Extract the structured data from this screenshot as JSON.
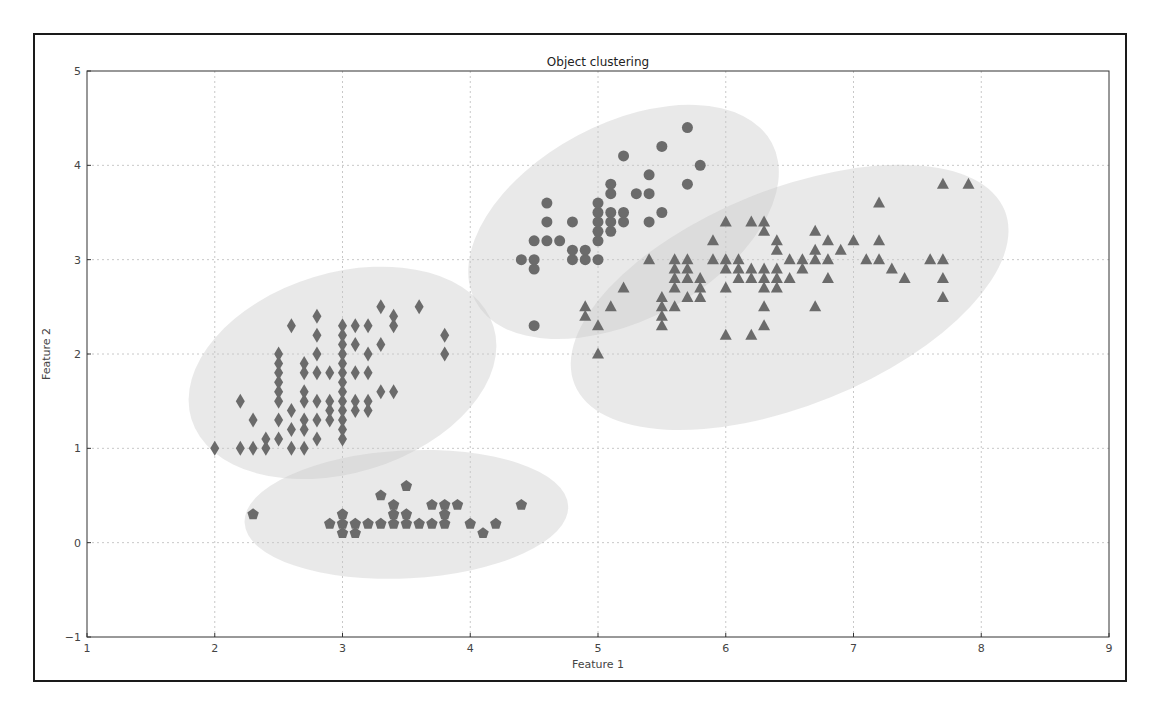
{
  "chart_data": {
    "type": "scatter",
    "title": "Object clustering",
    "xlabel": "Feature 1",
    "ylabel": "Feature 2",
    "xlim": [
      1,
      9
    ],
    "ylim": [
      -1,
      5
    ],
    "xticks": [
      1,
      2,
      3,
      4,
      5,
      6,
      7,
      8,
      9
    ],
    "yticks": [
      -1,
      0,
      1,
      2,
      3,
      4,
      5
    ],
    "grid": true,
    "legend": null,
    "marker_color": "#6b6b6b",
    "ellipse_color": "#c8c8c8",
    "series": [
      {
        "name": "cluster-diamond",
        "marker": "diamond",
        "points": [
          [
            2.0,
            1.0
          ],
          [
            2.2,
            1.0
          ],
          [
            2.3,
            1.0
          ],
          [
            2.4,
            1.0
          ],
          [
            2.4,
            1.1
          ],
          [
            2.5,
            1.1
          ],
          [
            2.6,
            1.0
          ],
          [
            2.7,
            1.0
          ],
          [
            2.2,
            1.5
          ],
          [
            2.3,
            1.3
          ],
          [
            2.5,
            1.3
          ],
          [
            2.5,
            1.5
          ],
          [
            2.5,
            1.6
          ],
          [
            2.5,
            1.7
          ],
          [
            2.5,
            1.8
          ],
          [
            2.5,
            1.9
          ],
          [
            2.5,
            2.0
          ],
          [
            2.6,
            1.2
          ],
          [
            2.6,
            1.4
          ],
          [
            2.6,
            2.3
          ],
          [
            2.7,
            1.2
          ],
          [
            2.7,
            1.3
          ],
          [
            2.7,
            1.5
          ],
          [
            2.7,
            1.6
          ],
          [
            2.7,
            1.8
          ],
          [
            2.7,
            1.9
          ],
          [
            2.8,
            1.1
          ],
          [
            2.8,
            1.3
          ],
          [
            2.8,
            1.5
          ],
          [
            2.8,
            1.8
          ],
          [
            2.8,
            2.0
          ],
          [
            2.8,
            2.2
          ],
          [
            2.8,
            2.4
          ],
          [
            2.9,
            1.3
          ],
          [
            2.9,
            1.4
          ],
          [
            2.9,
            1.5
          ],
          [
            2.9,
            1.8
          ],
          [
            3.0,
            1.1
          ],
          [
            3.0,
            1.2
          ],
          [
            3.0,
            1.3
          ],
          [
            3.0,
            1.4
          ],
          [
            3.0,
            1.5
          ],
          [
            3.0,
            1.6
          ],
          [
            3.0,
            1.7
          ],
          [
            3.0,
            1.8
          ],
          [
            3.0,
            1.9
          ],
          [
            3.0,
            2.0
          ],
          [
            3.0,
            2.1
          ],
          [
            3.0,
            2.2
          ],
          [
            3.0,
            2.3
          ],
          [
            3.1,
            1.4
          ],
          [
            3.1,
            1.5
          ],
          [
            3.1,
            1.8
          ],
          [
            3.1,
            2.1
          ],
          [
            3.1,
            2.3
          ],
          [
            3.2,
            1.4
          ],
          [
            3.2,
            1.5
          ],
          [
            3.2,
            1.8
          ],
          [
            3.2,
            2.0
          ],
          [
            3.2,
            2.3
          ],
          [
            3.3,
            1.6
          ],
          [
            3.3,
            2.1
          ],
          [
            3.3,
            2.5
          ],
          [
            3.4,
            1.6
          ],
          [
            3.4,
            2.3
          ],
          [
            3.4,
            2.4
          ],
          [
            3.6,
            2.5
          ],
          [
            3.8,
            2.0
          ],
          [
            3.8,
            2.2
          ]
        ]
      },
      {
        "name": "cluster-pentagon",
        "marker": "pentagon",
        "points": [
          [
            2.3,
            0.3
          ],
          [
            2.9,
            0.2
          ],
          [
            3.0,
            0.1
          ],
          [
            3.0,
            0.2
          ],
          [
            3.0,
            0.3
          ],
          [
            3.1,
            0.1
          ],
          [
            3.1,
            0.2
          ],
          [
            3.2,
            0.2
          ],
          [
            3.3,
            0.2
          ],
          [
            3.3,
            0.5
          ],
          [
            3.4,
            0.2
          ],
          [
            3.4,
            0.3
          ],
          [
            3.4,
            0.4
          ],
          [
            3.5,
            0.2
          ],
          [
            3.5,
            0.3
          ],
          [
            3.5,
            0.6
          ],
          [
            3.6,
            0.2
          ],
          [
            3.7,
            0.2
          ],
          [
            3.7,
            0.4
          ],
          [
            3.8,
            0.2
          ],
          [
            3.8,
            0.3
          ],
          [
            3.8,
            0.4
          ],
          [
            3.9,
            0.4
          ],
          [
            4.0,
            0.2
          ],
          [
            4.1,
            0.1
          ],
          [
            4.2,
            0.2
          ],
          [
            4.4,
            0.4
          ]
        ]
      },
      {
        "name": "cluster-circle",
        "marker": "circle",
        "points": [
          [
            4.5,
            2.3
          ],
          [
            4.4,
            3.0
          ],
          [
            4.5,
            2.9
          ],
          [
            4.5,
            3.0
          ],
          [
            4.5,
            3.2
          ],
          [
            4.6,
            3.2
          ],
          [
            4.6,
            3.4
          ],
          [
            4.6,
            3.6
          ],
          [
            4.7,
            3.2
          ],
          [
            4.8,
            3.0
          ],
          [
            4.8,
            3.1
          ],
          [
            4.8,
            3.4
          ],
          [
            4.9,
            3.0
          ],
          [
            4.9,
            3.1
          ],
          [
            5.0,
            3.0
          ],
          [
            5.0,
            3.2
          ],
          [
            5.0,
            3.3
          ],
          [
            5.0,
            3.4
          ],
          [
            5.0,
            3.5
          ],
          [
            5.0,
            3.6
          ],
          [
            5.1,
            3.3
          ],
          [
            5.1,
            3.4
          ],
          [
            5.1,
            3.5
          ],
          [
            5.1,
            3.7
          ],
          [
            5.1,
            3.8
          ],
          [
            5.2,
            3.4
          ],
          [
            5.2,
            3.5
          ],
          [
            5.2,
            4.1
          ],
          [
            5.3,
            3.7
          ],
          [
            5.4,
            3.4
          ],
          [
            5.4,
            3.7
          ],
          [
            5.4,
            3.9
          ],
          [
            5.5,
            3.5
          ],
          [
            5.5,
            4.2
          ],
          [
            5.7,
            3.8
          ],
          [
            5.7,
            4.4
          ],
          [
            5.8,
            4.0
          ]
        ]
      },
      {
        "name": "cluster-triangle",
        "marker": "triangle",
        "points": [
          [
            4.9,
            2.4
          ],
          [
            4.9,
            2.5
          ],
          [
            5.0,
            2.0
          ],
          [
            5.0,
            2.3
          ],
          [
            5.1,
            2.5
          ],
          [
            5.2,
            2.7
          ],
          [
            5.4,
            3.0
          ],
          [
            5.5,
            2.3
          ],
          [
            5.5,
            2.4
          ],
          [
            5.5,
            2.5
          ],
          [
            5.5,
            2.6
          ],
          [
            5.6,
            2.5
          ],
          [
            5.6,
            2.7
          ],
          [
            5.6,
            2.8
          ],
          [
            5.6,
            2.9
          ],
          [
            5.6,
            3.0
          ],
          [
            5.7,
            2.6
          ],
          [
            5.7,
            2.8
          ],
          [
            5.7,
            2.9
          ],
          [
            5.7,
            3.0
          ],
          [
            5.8,
            2.6
          ],
          [
            5.8,
            2.7
          ],
          [
            5.8,
            2.8
          ],
          [
            5.9,
            3.0
          ],
          [
            5.9,
            3.2
          ],
          [
            6.0,
            2.2
          ],
          [
            6.0,
            2.7
          ],
          [
            6.0,
            2.9
          ],
          [
            6.0,
            3.0
          ],
          [
            6.0,
            3.4
          ],
          [
            6.1,
            2.8
          ],
          [
            6.1,
            2.9
          ],
          [
            6.1,
            3.0
          ],
          [
            6.2,
            2.2
          ],
          [
            6.2,
            2.8
          ],
          [
            6.2,
            2.9
          ],
          [
            6.2,
            3.4
          ],
          [
            6.3,
            2.3
          ],
          [
            6.3,
            2.5
          ],
          [
            6.3,
            2.7
          ],
          [
            6.3,
            2.8
          ],
          [
            6.3,
            2.9
          ],
          [
            6.3,
            3.3
          ],
          [
            6.3,
            3.4
          ],
          [
            6.4,
            2.7
          ],
          [
            6.4,
            2.8
          ],
          [
            6.4,
            2.9
          ],
          [
            6.4,
            3.1
          ],
          [
            6.4,
            3.2
          ],
          [
            6.5,
            2.8
          ],
          [
            6.5,
            3.0
          ],
          [
            6.6,
            2.9
          ],
          [
            6.6,
            3.0
          ],
          [
            6.7,
            2.5
          ],
          [
            6.7,
            3.0
          ],
          [
            6.7,
            3.1
          ],
          [
            6.7,
            3.3
          ],
          [
            6.8,
            2.8
          ],
          [
            6.8,
            3.0
          ],
          [
            6.8,
            3.2
          ],
          [
            6.9,
            3.1
          ],
          [
            7.0,
            3.2
          ],
          [
            7.1,
            3.0
          ],
          [
            7.2,
            3.0
          ],
          [
            7.2,
            3.2
          ],
          [
            7.2,
            3.6
          ],
          [
            7.3,
            2.9
          ],
          [
            7.4,
            2.8
          ],
          [
            7.6,
            3.0
          ],
          [
            7.7,
            2.6
          ],
          [
            7.7,
            2.8
          ],
          [
            7.7,
            3.0
          ],
          [
            7.7,
            3.8
          ],
          [
            7.9,
            3.8
          ]
        ]
      }
    ],
    "ellipses": [
      {
        "name": "ellipse-diamond",
        "cx": 3.0,
        "cy": 1.8,
        "rx_px": 158,
        "ry_px": 100,
        "angle_deg": -17
      },
      {
        "name": "ellipse-pentagon",
        "cx": 3.5,
        "cy": 0.3,
        "rx_px": 162,
        "ry_px": 64,
        "angle_deg": -3
      },
      {
        "name": "ellipse-circle",
        "cx": 5.2,
        "cy": 3.4,
        "rx_px": 168,
        "ry_px": 98,
        "angle_deg": -28
      },
      {
        "name": "ellipse-triangle",
        "cx": 6.5,
        "cy": 2.6,
        "rx_px": 232,
        "ry_px": 108,
        "angle_deg": -22
      }
    ]
  }
}
